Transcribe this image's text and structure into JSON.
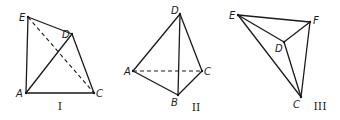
{
  "figures": [
    {
      "id": "I",
      "label": "I",
      "label_pos": [
        60,
        110
      ],
      "vertices": {
        "E": {
          "x": 28,
          "y": 17,
          "lx": 19,
          "ly": 21
        },
        "D": {
          "x": 72,
          "y": 34,
          "lx": 62,
          "ly": 38
        },
        "A": {
          "x": 26,
          "y": 93,
          "lx": 16,
          "ly": 97
        },
        "C": {
          "x": 94,
          "y": 93,
          "lx": 96,
          "ly": 97
        }
      },
      "solid_edges": [
        [
          "E",
          "D"
        ],
        [
          "E",
          "A"
        ],
        [
          "A",
          "D"
        ],
        [
          "D",
          "C"
        ],
        [
          "A",
          "C"
        ]
      ],
      "dashed_edges": [
        [
          "E",
          "C"
        ]
      ]
    },
    {
      "id": "II",
      "label": "II",
      "label_pos": [
        196,
        111
      ],
      "vertices": {
        "D": {
          "x": 180,
          "y": 14,
          "lx": 171,
          "ly": 14
        },
        "A": {
          "x": 133,
          "y": 71,
          "lx": 124,
          "ly": 75
        },
        "C": {
          "x": 202,
          "y": 71,
          "lx": 204,
          "ly": 75
        },
        "B": {
          "x": 178,
          "y": 95,
          "lx": 171,
          "ly": 106
        }
      },
      "solid_edges": [
        [
          "D",
          "A"
        ],
        [
          "D",
          "C"
        ],
        [
          "D",
          "B"
        ],
        [
          "A",
          "B"
        ],
        [
          "B",
          "C"
        ]
      ],
      "dashed_edges": [
        [
          "A",
          "C"
        ]
      ]
    },
    {
      "id": "III",
      "label": "III",
      "label_pos": [
        320,
        110
      ],
      "vertices": {
        "E": {
          "x": 238,
          "y": 15,
          "lx": 229,
          "ly": 19
        },
        "F": {
          "x": 310,
          "y": 22,
          "lx": 313,
          "ly": 24
        },
        "D": {
          "x": 284,
          "y": 42,
          "lx": 275,
          "ly": 52
        },
        "C": {
          "x": 301,
          "y": 97,
          "lx": 293,
          "ly": 108
        }
      },
      "solid_edges": [
        [
          "E",
          "F"
        ],
        [
          "E",
          "D"
        ],
        [
          "D",
          "F"
        ],
        [
          "E",
          "C"
        ],
        [
          "D",
          "C"
        ],
        [
          "F",
          "C"
        ]
      ],
      "dashed_edges": []
    }
  ]
}
